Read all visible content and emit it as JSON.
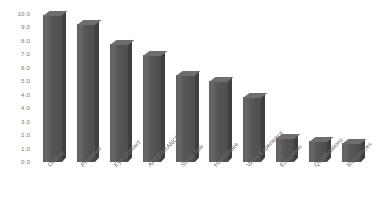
{
  "chart_data": {
    "type": "bar",
    "title": "",
    "subtitle": "",
    "xlabel": "",
    "ylabel": "",
    "ylim": [
      0.0,
      10.0
    ],
    "grid": false,
    "legend": false,
    "legend_position": "none",
    "bar_color": "#565656",
    "bar_top_color": "#6e6e6e",
    "bar_side_color": "#3f3f3f",
    "tick_label_color": "#7a7a7a",
    "background_color": "#ffffff",
    "y_tick_labels": [
      "10.0",
      "9.0",
      "8.0",
      "7.0",
      "6.0",
      "5.0",
      "4.0",
      "4.0",
      "3.0",
      "2.0",
      "1.0",
      "0.0"
    ],
    "categories": [
      "Ontime",
      "Prepared",
      "Eye Contact",
      "APPEARANCE",
      "Small Talk",
      "Handshake",
      "Work Experience",
      "Education",
      "Qualifications",
      "References"
    ],
    "values": [
      9.9,
      9.3,
      8.0,
      7.2,
      5.9,
      5.5,
      4.4,
      1.6,
      1.4,
      1.3
    ]
  }
}
